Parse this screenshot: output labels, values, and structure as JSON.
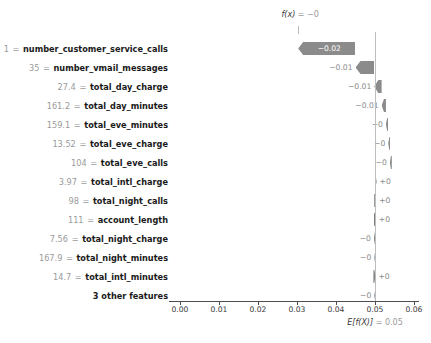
{
  "chart_data": {
    "type": "bar",
    "chart_style": "shap-waterfall",
    "title": "",
    "xlabel": "",
    "ylabel": "",
    "xlim": [
      0.0,
      0.06
    ],
    "xticks": [
      0.0,
      0.01,
      0.02,
      0.03,
      0.04,
      0.05,
      0.06
    ],
    "xtick_labels": [
      "0.00",
      "0.01",
      "0.02",
      "0.03",
      "0.04",
      "0.05",
      "0.06"
    ],
    "grid": false,
    "legend": null,
    "base_value": 0.05,
    "base_value_label": "E[f(X)]",
    "base_value_text": "= 0.05",
    "output_value_label": "f(x)",
    "output_value_text": "= −0",
    "categories": [
      "number_customer_service_calls",
      "number_vmail_messages",
      "total_day_charge",
      "total_day_minutes",
      "total_eve_minutes",
      "total_eve_charge",
      "total_eve_calls",
      "total_intl_charge",
      "total_night_calls",
      "account_length",
      "total_night_charge",
      "total_night_minutes",
      "total_intl_minutes",
      "3 other features"
    ],
    "feature_values": [
      "1",
      "35",
      "27.4",
      "161.2",
      "159.1",
      "13.52",
      "104",
      "3.97",
      "98",
      "111",
      "7.56",
      "167.9",
      "14.7",
      ""
    ],
    "value_labels": [
      "−0.02",
      "−0.01",
      "−0.01",
      "−0.01",
      "−0",
      "−0",
      "−0",
      "+0",
      "+0",
      "+0",
      "−0",
      "−0",
      "+0",
      "−0"
    ],
    "bar_start": [
      0.045,
      0.0498,
      0.0517,
      0.0528,
      0.0534,
      0.0538,
      0.0541,
      0.0499,
      0.0498,
      0.0497,
      0.0499,
      0.05,
      0.0496,
      0.05
    ],
    "bar_end": [
      0.0303,
      0.045,
      0.0498,
      0.0517,
      0.0528,
      0.0534,
      0.0538,
      0.0503,
      0.0501,
      0.05,
      0.0497,
      0.0498,
      0.05,
      0.0498
    ],
    "directions": [
      "negative",
      "negative",
      "negative",
      "negative",
      "negative",
      "negative",
      "negative",
      "positive",
      "positive",
      "positive",
      "negative",
      "negative",
      "positive",
      "negative"
    ],
    "colors": {
      "negative_bar": "#8b8b8b",
      "positive_bar": "#7f7f7f",
      "baseline": "#bdbdbd",
      "axis": "#4d4d4d",
      "label_text": "#1a1a1a",
      "value_text": "#9a9a9a",
      "inside_bar_text": "#ffffff",
      "outside_bar_text": "#8a8a8a"
    }
  }
}
